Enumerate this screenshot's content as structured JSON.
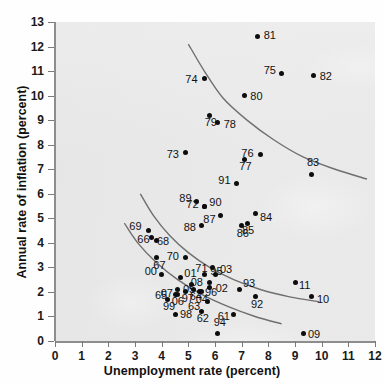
{
  "chart_data": {
    "type": "scatter",
    "title": "",
    "xlabel": "Unemployment rate (percent)",
    "ylabel": "Annual rate of inflation (percent)",
    "xlim": [
      0,
      12
    ],
    "ylim": [
      0,
      13
    ],
    "xticks": [
      0,
      1,
      2,
      3,
      4,
      5,
      6,
      7,
      8,
      9,
      10,
      11,
      12
    ],
    "yticks": [
      0,
      1,
      2,
      3,
      4,
      5,
      6,
      7,
      8,
      9,
      10,
      11,
      12,
      13
    ],
    "grid": false,
    "legend": "none",
    "point_color": "#0d0d0d",
    "curve_color": "#6f6f6f",
    "panel_color": "#e9e9e9",
    "points": [
      {
        "label": "61",
        "x": 6.7,
        "y": 1.1,
        "lx": -16,
        "ly": 2
      },
      {
        "label": "62",
        "x": 5.5,
        "y": 1.2,
        "lx": -5,
        "ly": 6
      },
      {
        "label": "63",
        "x": 5.7,
        "y": 1.6,
        "lx": -19,
        "ly": 4
      },
      {
        "label": "64",
        "x": 5.2,
        "y": 2.1,
        "lx": -4,
        "ly": 7
      },
      {
        "label": "65",
        "x": 4.5,
        "y": 1.9,
        "lx": -20,
        "ly": 1
      },
      {
        "label": "66",
        "x": 3.8,
        "y": 4.1,
        "lx": -19,
        "ly": -1
      },
      {
        "label": "67",
        "x": 3.8,
        "y": 3.4,
        "lx": -3,
        "ly": 7
      },
      {
        "label": "68",
        "x": 3.6,
        "y": 4.2,
        "lx": 6,
        "ly": 3
      },
      {
        "label": "69",
        "x": 3.5,
        "y": 4.5,
        "lx": -19,
        "ly": -5
      },
      {
        "label": "70",
        "x": 4.9,
        "y": 3.4,
        "lx": -19,
        "ly": -2
      },
      {
        "label": "71",
        "x": 5.9,
        "y": 3.0,
        "lx": -17,
        "ly": 1
      },
      {
        "label": "72",
        "x": 5.6,
        "y": 5.5,
        "lx": -18,
        "ly": -2
      },
      {
        "label": "73",
        "x": 4.9,
        "y": 7.7,
        "lx": -19,
        "ly": 2
      },
      {
        "label": "74",
        "x": 5.6,
        "y": 10.7,
        "lx": -19,
        "ly": 1
      },
      {
        "label": "75",
        "x": 8.5,
        "y": 10.9,
        "lx": -18,
        "ly": -4
      },
      {
        "label": "76",
        "x": 7.7,
        "y": 7.6,
        "lx": -19,
        "ly": -2
      },
      {
        "label": "77",
        "x": 7.1,
        "y": 7.4,
        "lx": -5,
        "ly": 7
      },
      {
        "label": "78",
        "x": 6.1,
        "y": 8.9,
        "lx": 6,
        "ly": 1
      },
      {
        "label": "79",
        "x": 5.8,
        "y": 9.2,
        "lx": -5,
        "ly": 7
      },
      {
        "label": "80",
        "x": 7.1,
        "y": 10.0,
        "lx": 6,
        "ly": 0
      },
      {
        "label": "81",
        "x": 7.6,
        "y": 12.4,
        "lx": 6,
        "ly": -2
      },
      {
        "label": "82",
        "x": 9.7,
        "y": 10.8,
        "lx": 6,
        "ly": 0
      },
      {
        "label": "83",
        "x": 9.6,
        "y": 6.8,
        "lx": -4,
        "ly": -12
      },
      {
        "label": "84",
        "x": 7.5,
        "y": 5.2,
        "lx": 5,
        "ly": 4
      },
      {
        "label": "85",
        "x": 7.2,
        "y": 4.8,
        "lx": -5,
        "ly": 7
      },
      {
        "label": "86",
        "x": 7.0,
        "y": 4.7,
        "lx": -5,
        "ly": 7
      },
      {
        "label": "87",
        "x": 6.2,
        "y": 5.1,
        "lx": -17,
        "ly": 3
      },
      {
        "label": "88",
        "x": 5.5,
        "y": 4.7,
        "lx": -18,
        "ly": 1
      },
      {
        "label": "89",
        "x": 5.3,
        "y": 5.7,
        "lx": -17,
        "ly": -3
      },
      {
        "label": "90",
        "x": 5.6,
        "y": 5.5,
        "lx": 5,
        "ly": -4
      },
      {
        "label": "91",
        "x": 6.8,
        "y": 6.4,
        "lx": -18,
        "ly": -4
      },
      {
        "label": "92",
        "x": 7.5,
        "y": 1.8,
        "lx": -4,
        "ly": 7
      },
      {
        "label": "93",
        "x": 6.9,
        "y": 2.1,
        "lx": 4,
        "ly": -6
      },
      {
        "label": "94",
        "x": 6.1,
        "y": 0.3,
        "lx": -4,
        "ly": -12
      },
      {
        "label": "95",
        "x": 5.6,
        "y": 2.7,
        "lx": 6,
        "ly": -4
      },
      {
        "label": "96",
        "x": 5.4,
        "y": 2.0,
        "lx": 6,
        "ly": 0
      },
      {
        "label": "97",
        "x": 4.9,
        "y": 2.0,
        "lx": -4,
        "ly": 6
      },
      {
        "label": "98",
        "x": 4.5,
        "y": 1.1,
        "lx": 5,
        "ly": 0
      },
      {
        "label": "99",
        "x": 4.2,
        "y": 1.7,
        "lx": -4,
        "ly": 7
      },
      {
        "label": "00",
        "x": 4.0,
        "y": 2.7,
        "lx": -17,
        "ly": -4
      },
      {
        "label": "01",
        "x": 4.7,
        "y": 2.6,
        "lx": 4,
        "ly": -4
      },
      {
        "label": "02",
        "x": 5.8,
        "y": 2.2,
        "lx": 6,
        "ly": 1
      },
      {
        "label": "03",
        "x": 6.0,
        "y": 2.7,
        "lx": 5,
        "ly": -6
      },
      {
        "label": "04",
        "x": 5.5,
        "y": 2.0,
        "lx": -6,
        "ly": 7
      },
      {
        "label": "05",
        "x": 5.1,
        "y": 2.3,
        "lx": -8,
        "ly": 4
      },
      {
        "label": "06",
        "x": 4.6,
        "y": 1.9,
        "lx": -6,
        "ly": 7
      },
      {
        "label": "07",
        "x": 4.6,
        "y": 2.1,
        "lx": -17,
        "ly": 4
      },
      {
        "label": "08",
        "x": 5.8,
        "y": 2.4,
        "lx": -19,
        "ly": 0
      },
      {
        "label": "09",
        "x": 9.3,
        "y": 0.3,
        "lx": 5,
        "ly": 0
      },
      {
        "label": "10",
        "x": 9.6,
        "y": 1.8,
        "lx": 6,
        "ly": 2
      },
      {
        "label": "11",
        "x": 9.0,
        "y": 2.4,
        "lx": 4,
        "ly": 3
      }
    ],
    "curves": [
      {
        "name": "upper-phillips-curve",
        "points": [
          [
            5.0,
            12.1
          ],
          [
            5.6,
            11.0
          ],
          [
            6.3,
            9.9
          ],
          [
            7.2,
            9.0
          ],
          [
            8.2,
            8.2
          ],
          [
            9.3,
            7.5
          ],
          [
            10.5,
            7.0
          ],
          [
            11.7,
            6.6
          ]
        ]
      },
      {
        "name": "middle-phillips-curve",
        "points": [
          [
            3.2,
            6.0
          ],
          [
            3.7,
            5.1
          ],
          [
            4.3,
            4.3
          ],
          [
            5.0,
            3.6
          ],
          [
            5.8,
            3.0
          ],
          [
            6.7,
            2.5
          ],
          [
            7.7,
            2.1
          ],
          [
            8.8,
            1.8
          ],
          [
            9.9,
            1.6
          ]
        ]
      },
      {
        "name": "lower-phillips-curve",
        "points": [
          [
            2.6,
            4.8
          ],
          [
            3.1,
            4.0
          ],
          [
            3.8,
            3.2
          ],
          [
            4.6,
            2.5
          ],
          [
            5.5,
            1.9
          ],
          [
            6.5,
            1.4
          ],
          [
            7.5,
            1.0
          ],
          [
            8.5,
            0.7
          ]
        ]
      }
    ]
  }
}
